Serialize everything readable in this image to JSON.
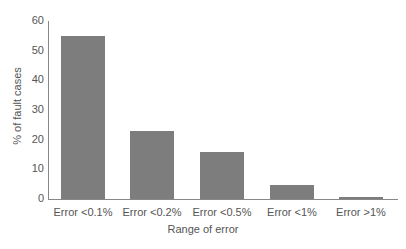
{
  "chart_data": {
    "type": "bar",
    "title": "",
    "xlabel": "Range of error",
    "ylabel": "% of fault cases",
    "categories": [
      "Error <0.1%",
      "Error <0.2%",
      "Error <0.5%",
      "Error <1%",
      "Error >1%"
    ],
    "values": [
      55,
      23,
      16,
      4.7,
      0.7
    ],
    "ylim": [
      0,
      60
    ],
    "yticks": [
      0,
      10,
      20,
      30,
      40,
      50,
      60
    ],
    "grid": false,
    "legend": null,
    "bar_color": "#7d7d7d"
  }
}
